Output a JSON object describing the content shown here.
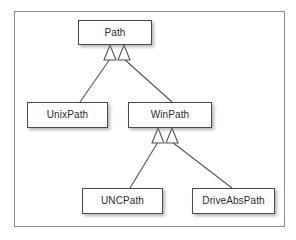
{
  "diagram": {
    "kind": "uml-class-inheritance-diagram",
    "background_color": "#ffffff",
    "frame": {
      "x": 14,
      "y": 11,
      "width": 271,
      "height": 216,
      "border_color": "#8d8d8d"
    },
    "style": {
      "box_fill": "#ffffff",
      "box_border_color": "#4a4a4a",
      "text_color": "#2b2b2b",
      "connector_color": "#555555",
      "shadow_color": "rgba(120,120,120,0.55)",
      "arrowhead": "hollow-triangle-generalization"
    },
    "classes": [
      {
        "id": "path",
        "label": "Path",
        "x": 78,
        "y": 20,
        "width": 74,
        "height": 25
      },
      {
        "id": "unixpath",
        "label": "UnixPath",
        "x": 27,
        "y": 102,
        "width": 81,
        "height": 26
      },
      {
        "id": "winpath",
        "label": "WinPath",
        "x": 128,
        "y": 102,
        "width": 84,
        "height": 26
      },
      {
        "id": "uncpath",
        "label": "UNCPath",
        "x": 82,
        "y": 188,
        "width": 81,
        "height": 26
      },
      {
        "id": "driveabspath",
        "label": "DriveAbsPath",
        "x": 192,
        "y": 188,
        "width": 83,
        "height": 26
      }
    ],
    "relations": [
      {
        "id": "unixpath-to-path",
        "type": "generalization",
        "from": "unixpath",
        "to": "path",
        "line": {
          "x1": 80,
          "y1": 102,
          "x2": 110,
          "y2": 59
        },
        "arrow": {
          "tip_x": 110,
          "tip_y": 45,
          "base_left_x": 104,
          "base_right_x": 116,
          "base_y": 60
        }
      },
      {
        "id": "winpath-to-path",
        "type": "generalization",
        "from": "winpath",
        "to": "path",
        "line": {
          "x1": 172,
          "y1": 102,
          "x2": 124,
          "y2": 59
        },
        "arrow": {
          "tip_x": 124,
          "tip_y": 45,
          "base_left_x": 118,
          "base_right_x": 130,
          "base_y": 60
        }
      },
      {
        "id": "uncpath-to-winpath",
        "type": "generalization",
        "from": "uncpath",
        "to": "winpath",
        "line": {
          "x1": 130,
          "y1": 188,
          "x2": 158,
          "y2": 142
        },
        "arrow": {
          "tip_x": 158,
          "tip_y": 128,
          "base_left_x": 152,
          "base_right_x": 164,
          "base_y": 143
        }
      },
      {
        "id": "driveabspath-to-winpath",
        "type": "generalization",
        "from": "driveabspath",
        "to": "winpath",
        "line": {
          "x1": 232,
          "y1": 188,
          "x2": 172,
          "y2": 142
        },
        "arrow": {
          "tip_x": 172,
          "tip_y": 128,
          "base_left_x": 166,
          "base_right_x": 178,
          "base_y": 143
        }
      }
    ]
  }
}
